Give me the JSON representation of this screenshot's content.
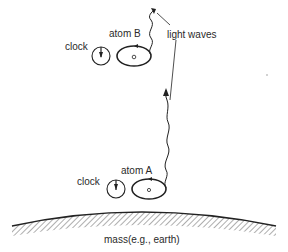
{
  "diagram": {
    "labels": {
      "atom_b": "atom B",
      "atom_a": "atom A",
      "clock_b": "clock",
      "clock_a": "clock",
      "light_waves": "light waves",
      "mass": "mass(e.g., earth)"
    },
    "colors": {
      "ink": "#222222",
      "background": "#ffffff"
    }
  }
}
